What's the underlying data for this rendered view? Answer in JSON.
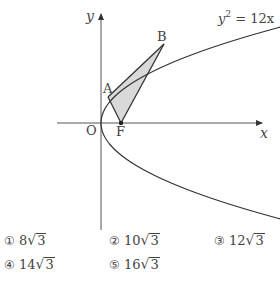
{
  "figure": {
    "axis_x_label": "x",
    "axis_y_label": "y",
    "origin_label": "O",
    "curve_label_base": "y",
    "curve_label_exp": "2",
    "curve_label_rest": " = 12x",
    "points": {
      "A": "A",
      "B": "B",
      "F": "F"
    },
    "curve_equation": "y^2 = 12x",
    "shaded_region": "triangle ABF",
    "colors": {
      "line": "#333333",
      "shade": "#d9d9d9",
      "axis": "#555555"
    }
  },
  "choices": [
    {
      "marker": "①",
      "coef": "8",
      "radicand": "3"
    },
    {
      "marker": "②",
      "coef": "10",
      "radicand": "3"
    },
    {
      "marker": "③",
      "coef": "12",
      "radicand": "3"
    },
    {
      "marker": "④",
      "coef": "14",
      "radicand": "3"
    },
    {
      "marker": "⑤",
      "coef": "16",
      "radicand": "3"
    }
  ]
}
